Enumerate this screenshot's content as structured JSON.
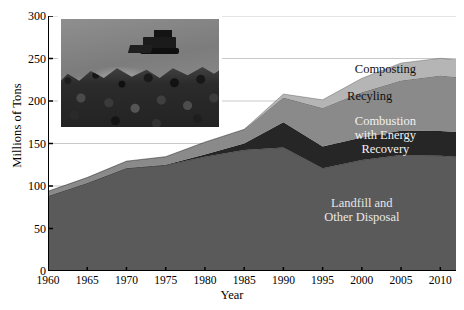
{
  "chart_data": {
    "type": "area",
    "title": "",
    "subtitle": "",
    "xlabel": "Year",
    "ylabel": "Millions of Tons",
    "xlim": [
      1960,
      2012
    ],
    "ylim": [
      0,
      300
    ],
    "grid": true,
    "stacked": true,
    "legend_position": "inline-annotations",
    "x": [
      1960,
      1965,
      1970,
      1975,
      1980,
      1985,
      1990,
      1995,
      2000,
      2005,
      2010,
      2012
    ],
    "xticks": [
      "1960",
      "1965",
      "1970",
      "1975",
      "1980",
      "1985",
      "1990",
      "1995",
      "2000",
      "2005",
      "2010"
    ],
    "yticks": [
      "0",
      "50",
      "100",
      "150",
      "200",
      "250",
      "300"
    ],
    "series": [
      {
        "name": "Landfill and Other Disposal",
        "color": "#5a5a5a",
        "label_color": "#e8e8e8",
        "values": [
          88.2,
          103.4,
          120.8,
          124.3,
          134.4,
          142.3,
          145.3,
          120.9,
          130.5,
          136.4,
          135.5,
          134.3
        ]
      },
      {
        "name": "Combustion with Energy Recovery",
        "color": "#262626",
        "label_color": "#f2f2f2",
        "values": [
          0.0,
          0.2,
          0.4,
          0.7,
          2.7,
          7.6,
          29.7,
          25.6,
          26.7,
          28.5,
          29.3,
          29.3
        ]
      },
      {
        "name": "Recyling",
        "color": "#8a8a8a",
        "label_color": "#111111",
        "values": [
          5.6,
          6.4,
          8.0,
          9.5,
          14.5,
          16.7,
          29.0,
          45.3,
          53.0,
          59.2,
          65.3,
          64.6
        ]
      },
      {
        "name": "Composting",
        "color": "#b5b5b5",
        "label_color": "#111111",
        "values": [
          0.0,
          0.0,
          0.0,
          0.0,
          0.0,
          0.0,
          4.2,
          9.6,
          16.5,
          20.6,
          20.2,
          20.3
        ]
      }
    ],
    "totals": [
      93.8,
      110.0,
      129.2,
      134.5,
      151.6,
      166.6,
      208.2,
      201.4,
      226.7,
      244.7,
      250.3,
      248.5
    ],
    "annotations": [
      {
        "text": "Composting",
        "series": "Composting",
        "x": 2003,
        "y": 238
      },
      {
        "text": "Recyling",
        "series": "Recyling",
        "x": 2001,
        "y": 206
      },
      {
        "text": "Combustion\nwith Energy Recovery",
        "series": "Combustion with Energy Recovery",
        "x": 2003,
        "y": 160
      },
      {
        "text": "Landfill and\nOther Disposal",
        "series": "Landfill and Other Disposal",
        "x": 2000,
        "y": 72
      }
    ]
  },
  "inset": {
    "name": "landfill-bulldozer-photo",
    "description": "Bulldozer pushing waste on a landfill"
  },
  "bottom_note": ""
}
